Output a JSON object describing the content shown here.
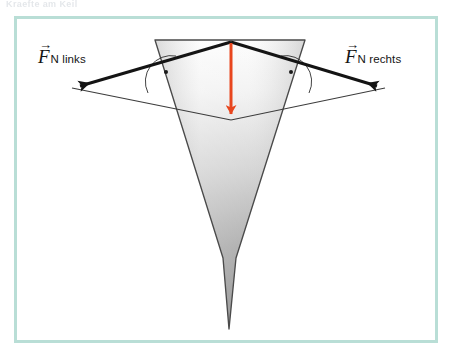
{
  "page": {
    "header_fragment": "Kraefte am Keil",
    "background_color": "#ffffff",
    "width": 452,
    "height": 360
  },
  "frame": {
    "name": "figure-frame",
    "border_color": "#b9ded6",
    "fill_color": "#ffffff",
    "x": 14,
    "y": 16,
    "width": 424,
    "height": 327,
    "border_width": 3
  },
  "diagram": {
    "colors": {
      "vector_line": "#141414",
      "construction_line": "#3c3c3c",
      "weight_arrow": "#e8461e",
      "wedge_outline": "#4a4a4a",
      "wedge_fill_light": "#fbfbfb",
      "wedge_fill_dark": "#8d8d8d"
    },
    "wedge": {
      "name": "wedge-shape",
      "description": "grauer Keil",
      "points": "155,40 305,40 236,260 229,329 223,260",
      "top_left": [
        155,
        40
      ],
      "top_right": [
        305,
        40
      ],
      "tip": [
        229,
        329
      ]
    },
    "force_parallelogram": {
      "name": "force-parallelogram",
      "apex": [
        231,
        42
      ],
      "left_tip": [
        72,
        88
      ],
      "right_tip": [
        385,
        88
      ],
      "bottom": [
        231,
        120
      ]
    },
    "weight_arrow": {
      "name": "weight-force-arrow",
      "from": [
        231,
        42
      ],
      "to": [
        231,
        120
      ],
      "color": "#e8461e",
      "stroke_width": 3
    },
    "right_angle_markers": [
      {
        "name": "right-angle-marker-left",
        "center": [
          165,
          73
        ],
        "radius": 22
      },
      {
        "name": "right-angle-marker-right",
        "center": [
          297,
          73
        ],
        "radius": 22
      }
    ],
    "labels": {
      "left": {
        "name": "force-label-left",
        "symbol": "F",
        "arrow": "→",
        "subscript": "N links",
        "full_text": "F⃗ N links"
      },
      "right": {
        "name": "force-label-right",
        "symbol": "F",
        "arrow": "→",
        "subscript": "N rechts",
        "full_text": "F⃗ N rechts"
      }
    }
  }
}
